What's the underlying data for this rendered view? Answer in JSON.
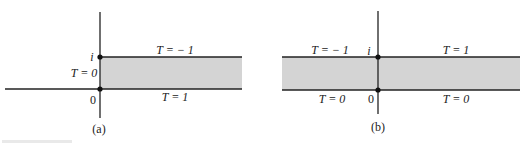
{
  "figure": {
    "panels": [
      {
        "id": "a",
        "caption": "(a)",
        "origin_label": "0",
        "imag_unit_label": "i",
        "labels": {
          "top_boundary": "T = − 1",
          "bottom_boundary": "T = 1",
          "left_edge": "T = 0"
        },
        "description": "Half-strip 0 < Im z < 1, Re z > 0 (shaded)"
      },
      {
        "id": "b",
        "caption": "(b)",
        "origin_label": "0",
        "imag_unit_label": "i",
        "labels": {
          "top_left_boundary": "T = − 1",
          "top_right_boundary": "T = 1",
          "bottom_left_boundary": "T = 0",
          "bottom_right_boundary": "T = 0"
        },
        "description": "Infinite strip 0 < Im z < 1 (shaded)"
      }
    ],
    "colors": {
      "shade": "#d4d4d4",
      "line": "#222222",
      "background": "#ffffff"
    }
  }
}
